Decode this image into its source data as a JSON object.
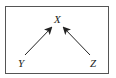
{
  "diagram": {
    "nodes": [
      {
        "id": "X",
        "label": "X"
      },
      {
        "id": "Y",
        "label": "Y"
      },
      {
        "id": "Z",
        "label": "Z"
      }
    ],
    "edges": [
      {
        "from": "Y",
        "to": "X"
      },
      {
        "from": "Z",
        "to": "X"
      }
    ],
    "colors": {
      "line": "#222222",
      "border": "#555555"
    }
  }
}
